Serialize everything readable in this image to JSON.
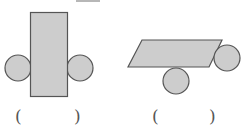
{
  "figures": [
    {
      "id": "figure-1",
      "description": "rectangle with two circles attached at its left and right sides",
      "rect": {
        "x": 30,
        "y": 12,
        "w": 37,
        "h": 84
      },
      "circles": [
        {
          "cx": 18,
          "cy": 68,
          "r": 13
        },
        {
          "cx": 80,
          "cy": 68,
          "r": 13
        }
      ],
      "answer_open": "(",
      "answer_close": ")"
    },
    {
      "id": "figure-2",
      "description": "parallelogram with one circle below and one circle at its right end",
      "parallelogram": [
        [
          142,
          40
        ],
        [
          222,
          40
        ],
        [
          209,
          67
        ],
        [
          128,
          67
        ]
      ],
      "circles": [
        {
          "cx": 176,
          "cy": 81,
          "r": 13
        },
        {
          "cx": 227,
          "cy": 58,
          "r": 13
        }
      ],
      "answer_open": "(",
      "answer_close": ")"
    }
  ],
  "top_mark": {
    "x1": 76,
    "x2": 100,
    "y": 1
  },
  "colors": {
    "fill": "#cdcdcd",
    "stroke": "#555555",
    "background": "#ffffff"
  }
}
